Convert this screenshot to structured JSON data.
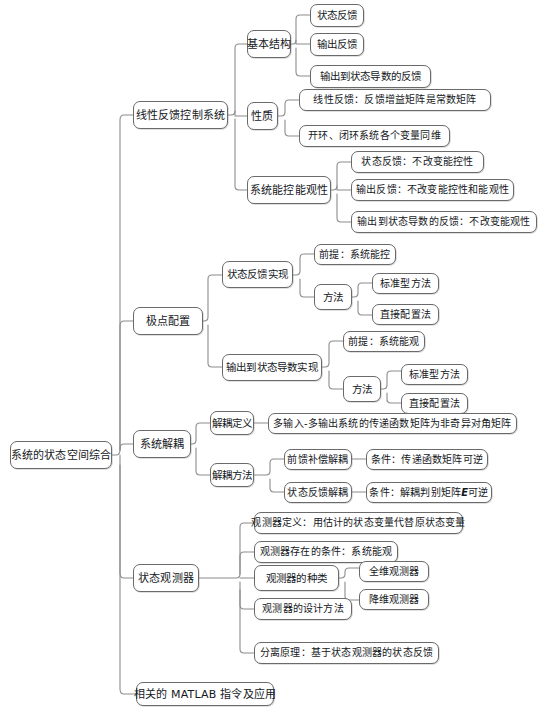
{
  "diagram": {
    "title": "系统的状态空间综合",
    "type": "mind-map",
    "orientation": "left-to-right",
    "style": {
      "box_border_color": "#6a6a6a",
      "box_fill_color": "#ffffff",
      "text_color": "#15181c",
      "link_color": "#8c8c8c"
    },
    "root": {
      "label": "系统的状态空间综合"
    },
    "branches": [
      {
        "label": "线性反馈控制系统",
        "children": [
          {
            "label": "基本结构",
            "children": [
              {
                "label": "状态反馈"
              },
              {
                "label": "输出反馈"
              },
              {
                "label": "输出到状态导数的反馈"
              }
            ]
          },
          {
            "label": "性质",
            "children": [
              {
                "label": "线性反馈：反馈增益矩阵是常数矩阵"
              },
              {
                "label": "开环、闭环系统各个变量同维"
              }
            ]
          },
          {
            "label": "系统能控能观性",
            "children": [
              {
                "label": "状态反馈：不改变能控性"
              },
              {
                "label": "输出反馈：不改变能控性和能观性"
              },
              {
                "label": "输出到状态导数的反馈：不改变能观性"
              }
            ]
          }
        ]
      },
      {
        "label": "极点配置",
        "children": [
          {
            "label": "状态反馈实现",
            "children": [
              {
                "label": "前提：系统能控"
              },
              {
                "label": "方法",
                "children": [
                  {
                    "label": "标准型方法"
                  },
                  {
                    "label": "直接配置法"
                  }
                ]
              }
            ]
          },
          {
            "label": "输出到状态导数实现",
            "children": [
              {
                "label": "前提：系统能观"
              },
              {
                "label": "方法",
                "children": [
                  {
                    "label": "标准型方法"
                  },
                  {
                    "label": "直接配置法"
                  }
                ]
              }
            ]
          }
        ]
      },
      {
        "label": "系统解耦",
        "children": [
          {
            "label": "解耦定义",
            "children": [
              {
                "label": "多输入-多输出系统的传递函数矩阵为非奇异对角矩阵"
              }
            ]
          },
          {
            "label": "解耦方法",
            "children": [
              {
                "label": "前馈补偿解耦",
                "children": [
                  {
                    "label": "条件：传递函数矩阵可逆"
                  }
                ]
              },
              {
                "label": "状态反馈解耦",
                "children": [
                  {
                    "label_pre": "条件：解耦判别矩阵 ",
                    "label_em": "E",
                    "label_post": " 可逆"
                  }
                ]
              }
            ]
          }
        ]
      },
      {
        "label": "状态观测器",
        "children": [
          {
            "label": "观测器定义：用估计的状态变量代替原状态变量"
          },
          {
            "label": "观测器存在的条件：系统能观"
          },
          {
            "label": "观测器的种类",
            "children": [
              {
                "label": "全维观测器"
              },
              {
                "label": "降维观测器"
              }
            ]
          },
          {
            "label": "观测器的设计方法"
          },
          {
            "label": "分离原理：基于状态观测器的状态反馈"
          }
        ]
      },
      {
        "label": "相关的 MATLAB 指令及应用"
      }
    ]
  }
}
